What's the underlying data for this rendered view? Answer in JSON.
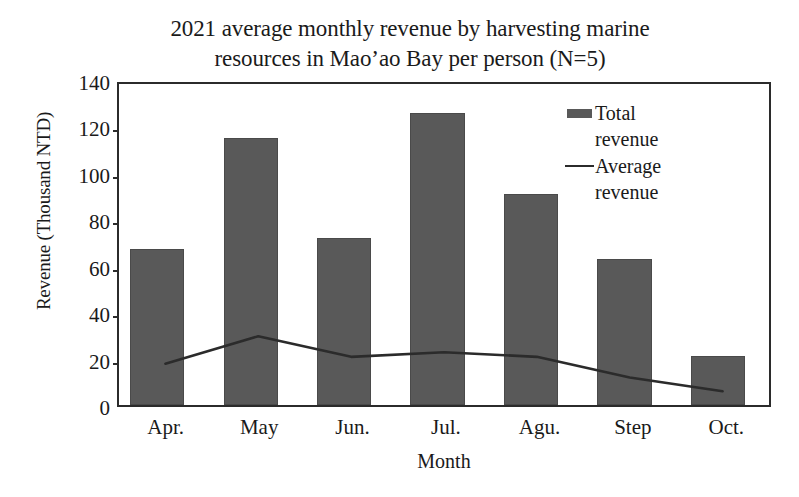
{
  "chart_data": {
    "type": "bar",
    "title": "2021 average monthly revenue by harvesting marine resources in Mao’ao Bay per person (N=5)",
    "title_line1": "2021 average monthly revenue by harvesting marine",
    "title_line2": "resources in Mao’ao Bay per person (N=5)",
    "xlabel": "Month",
    "ylabel": "Revenue (Thousand NTD)",
    "categories": [
      "Apr.",
      "May",
      "Jun.",
      "Jul.",
      "Agu.",
      "Step",
      "Oct."
    ],
    "ylim": [
      0,
      140
    ],
    "yticks": [
      0,
      20,
      40,
      60,
      80,
      100,
      120,
      140
    ],
    "ytick_labels": [
      "0",
      "20",
      "40",
      "60",
      "80",
      "100",
      "120",
      "140"
    ],
    "grid": false,
    "legend_position": "inside-top-right",
    "series": [
      {
        "name": "Total revenue",
        "type": "bar",
        "color": "#595959",
        "values": [
          67,
          115,
          72,
          126,
          91,
          63,
          21
        ]
      },
      {
        "name": "Average revenue",
        "type": "line",
        "color": "#2b2b2b",
        "values": [
          18,
          30,
          21,
          23,
          21,
          12,
          6
        ]
      }
    ]
  },
  "legend": {
    "items": [
      {
        "label_line1": "Total",
        "label_line2": "revenue",
        "swatch": "bar-swatch"
      },
      {
        "label_line1": "Average",
        "label_line2": "revenue",
        "swatch": "line-swatch"
      }
    ]
  },
  "colors": {
    "bar_fill": "#595959",
    "line_stroke": "#2b2b2b",
    "axis": "#2b2b2b",
    "background": "#ffffff",
    "text": "#1a1a1a"
  }
}
